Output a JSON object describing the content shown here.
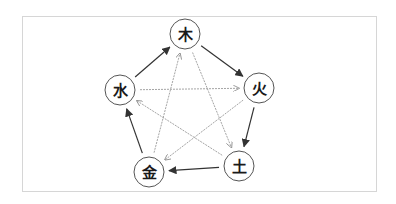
{
  "diagram": {
    "title": "",
    "colors": {
      "border": "#d6d6d6",
      "node_stroke": "#555555",
      "generating_edge": "#333333",
      "overcoming_edge": "#9a9a9a"
    },
    "nodes": [
      {
        "id": "wood",
        "label": "木",
        "x": 185,
        "y": 34
      },
      {
        "id": "fire",
        "label": "火",
        "x": 259,
        "y": 88
      },
      {
        "id": "earth",
        "label": "土",
        "x": 239,
        "y": 166
      },
      {
        "id": "metal",
        "label": "金",
        "x": 149,
        "y": 172
      },
      {
        "id": "water",
        "label": "水",
        "x": 120,
        "y": 90
      }
    ],
    "edges": [
      {
        "from": "wood",
        "to": "fire",
        "type": "generating"
      },
      {
        "from": "fire",
        "to": "earth",
        "type": "generating"
      },
      {
        "from": "earth",
        "to": "metal",
        "type": "generating"
      },
      {
        "from": "metal",
        "to": "water",
        "type": "generating"
      },
      {
        "from": "water",
        "to": "wood",
        "type": "generating"
      },
      {
        "from": "wood",
        "to": "earth",
        "type": "overcoming"
      },
      {
        "from": "earth",
        "to": "water",
        "type": "overcoming"
      },
      {
        "from": "water",
        "to": "fire",
        "type": "overcoming"
      },
      {
        "from": "fire",
        "to": "metal",
        "type": "overcoming"
      },
      {
        "from": "metal",
        "to": "wood",
        "type": "overcoming"
      }
    ]
  }
}
